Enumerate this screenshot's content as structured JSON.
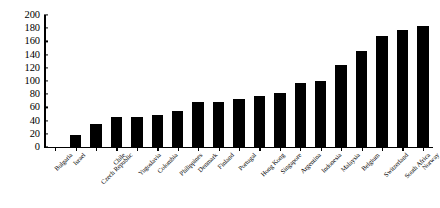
{
  "chart_data": {
    "type": "bar",
    "title": "",
    "subtitle": "",
    "xlabel": "",
    "ylabel": "",
    "ylim": [
      0,
      200
    ],
    "ytick_step": 20,
    "grid": false,
    "legend": "none",
    "bar_color": "#000000",
    "axis_color": "#000000",
    "background": "#ffffff",
    "label_rotation_deg": -45,
    "categories": [
      "Bulgaria",
      "Israel",
      "Czech Republic",
      "Chile",
      "Yugoslavia",
      "Colombia",
      "Philippines",
      "Denmark",
      "Finland",
      "Portugal",
      "Hong Kong",
      "Singapore",
      "Argentina",
      "Indonesia",
      "Malaysia",
      "Belgium",
      "Switzerland",
      "South Africa",
      "Norway"
    ],
    "values": [
      0,
      18,
      35,
      45,
      45,
      48,
      55,
      68,
      68,
      72,
      78,
      82,
      97,
      100,
      125,
      145,
      168,
      178,
      183
    ],
    "yticks": [
      0,
      20,
      40,
      60,
      80,
      100,
      120,
      140,
      160,
      180,
      200
    ]
  }
}
